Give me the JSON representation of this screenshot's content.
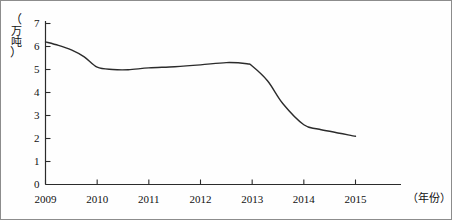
{
  "chart_data": {
    "type": "line",
    "title": "",
    "subtitle": "",
    "xlabel": "（年份）",
    "ylabel": "（万吨）",
    "ylabel_chars": [
      "（",
      "万",
      "吨",
      "）"
    ],
    "categories": [
      "2009",
      "2010",
      "2011",
      "2012",
      "2013",
      "2014",
      "2015"
    ],
    "x": [
      2009,
      2010,
      2011,
      2012,
      2013,
      2014,
      2015
    ],
    "values": [
      6.2,
      5.0,
      5.1,
      5.25,
      5.2,
      2.5,
      2.1
    ],
    "series": [
      {
        "name": "产量",
        "values": [
          6.2,
          5.0,
          5.1,
          5.25,
          5.2,
          2.5,
          2.1
        ]
      }
    ],
    "dense_points": [
      [
        2009.0,
        6.2
      ],
      [
        2009.25,
        6.05
      ],
      [
        2009.5,
        5.85
      ],
      [
        2009.75,
        5.55
      ],
      [
        2010.0,
        5.1
      ],
      [
        2010.3,
        5.0
      ],
      [
        2010.6,
        4.99
      ],
      [
        2011.0,
        5.07
      ],
      [
        2011.5,
        5.12
      ],
      [
        2012.0,
        5.2
      ],
      [
        2012.5,
        5.3
      ],
      [
        2012.9,
        5.25
      ],
      [
        2013.0,
        5.15
      ],
      [
        2013.3,
        4.5
      ],
      [
        2013.6,
        3.5
      ],
      [
        2014.0,
        2.6
      ],
      [
        2014.3,
        2.4
      ],
      [
        2015.0,
        2.1
      ]
    ],
    "yticks": [
      "0",
      "1",
      "2",
      "3",
      "4",
      "5",
      "6",
      "7"
    ],
    "ytick_values": [
      0,
      1,
      2,
      3,
      4,
      5,
      6,
      7
    ],
    "xtick_labels": [
      "2009",
      "2010",
      "2011",
      "2012",
      "2013",
      "2014",
      "2015"
    ],
    "ylim": [
      0,
      7
    ],
    "xlim": [
      2009,
      2015
    ],
    "grid": false,
    "legend": "none",
    "line_color": "#2b2b2b",
    "axis_color": "#2b2b2b",
    "border_color": "#8c8c8c",
    "background": "#ffffff"
  }
}
